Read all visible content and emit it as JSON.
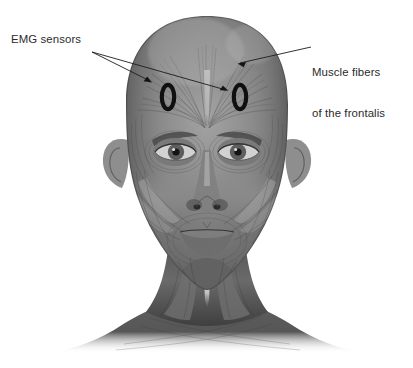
{
  "figure": {
    "type": "anatomical-illustration",
    "background_color": "#ffffff",
    "label_color": "#2b2b2b",
    "marker_color": "#111111"
  },
  "labels": {
    "emg": {
      "text": "EMG sensors",
      "x": 11,
      "y": 33,
      "leader_lines": 2
    },
    "muscle": {
      "line1": "Muscle fibers",
      "line2": "of the frontalis",
      "x": 312,
      "y": 39,
      "leader_lines": 1
    }
  },
  "markers": [
    {
      "name": "emg-sensor-left",
      "glyph": "O",
      "cx": 168,
      "cy": 97
    },
    {
      "name": "emg-sensor-right",
      "glyph": "O",
      "cx": 240,
      "cy": 97
    }
  ],
  "anatomy": {
    "regions": [
      "frontalis",
      "temporalis",
      "orbicularis oculi",
      "zygomaticus",
      "masseter",
      "orbicularis oris",
      "depressor anguli oris",
      "platysma",
      "sternocleidomastoid"
    ]
  }
}
